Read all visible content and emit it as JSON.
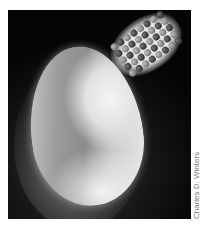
{
  "image": {
    "subject": "egg with molecular lattice model",
    "credit": "Charles D. Winters"
  },
  "atoms": [
    "a",
    "b",
    "a",
    "b",
    "a",
    "b",
    "a",
    "b",
    "b",
    "a",
    "b",
    "a",
    "b",
    "a",
    "b",
    "a",
    "a",
    "b",
    "a",
    "b",
    "a",
    "b",
    "a",
    "b",
    "b",
    "a",
    "b",
    "a",
    "b",
    "a",
    "b",
    "a",
    "a",
    "b",
    "a",
    "b",
    "a",
    "b",
    "a",
    "b"
  ]
}
